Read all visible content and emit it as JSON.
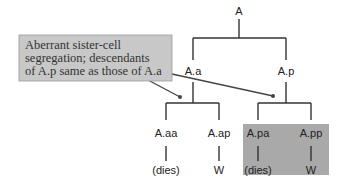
{
  "diagram": {
    "root": "A",
    "level1": {
      "left": "A.a",
      "right": "A.p"
    },
    "level2": {
      "aa": "A.aa",
      "ap": "A.ap",
      "pa": "A.pa",
      "pp": "A.pp"
    },
    "fates": {
      "aa": "(dies)",
      "ap": "W",
      "pa": "(dies)",
      "pp": "W"
    },
    "callout": {
      "line1": "Aberrant sister-cell",
      "line2": "segregation; descendants",
      "line3": "of A.p same as those of A.a"
    },
    "colors": {
      "callout_fill": "#c8c8c8",
      "highlight_fill": "#a9a9a9",
      "line": "#333333"
    }
  }
}
